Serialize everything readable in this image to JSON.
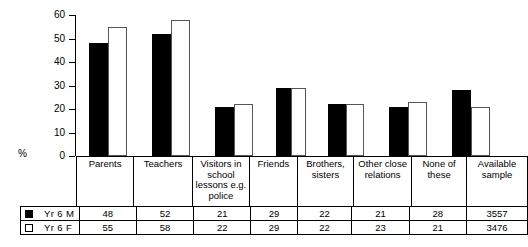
{
  "chart_data": {
    "type": "bar",
    "title": "",
    "xlabel": "",
    "ylabel": "%",
    "ylim": [
      0,
      60
    ],
    "yticks": [
      0,
      10,
      20,
      30,
      40,
      50,
      60
    ],
    "ytick_labels": [
      "0",
      "10",
      "20",
      "30",
      "40",
      "50",
      "60"
    ],
    "grid": false,
    "legend_position": "bottom-left-table",
    "categories": [
      "Parents",
      "Teachers",
      "Visitors in school lessons e.g. police",
      "Friends",
      "Brothers, sisters",
      "Other close relations",
      "None of these"
    ],
    "category_lines": [
      [
        "Parents"
      ],
      [
        "Teachers"
      ],
      [
        "Visitors in",
        "school",
        "lessons e.g.",
        "police"
      ],
      [
        "Friends"
      ],
      [
        "Brothers,",
        "sisters"
      ],
      [
        "Other close",
        "relations"
      ],
      [
        "None of these"
      ]
    ],
    "series": [
      {
        "name": "Yr 6 M",
        "color": "#000000",
        "fill": "solid",
        "values": [
          48,
          52,
          21,
          29,
          22,
          21,
          28
        ],
        "available_sample": "3557"
      },
      {
        "name": "Yr 6 F",
        "color": "#ffffff",
        "fill": "hollow",
        "values": [
          55,
          58,
          22,
          29,
          22,
          23,
          21
        ],
        "available_sample": "3476"
      }
    ],
    "extra_column_header": [
      "Available",
      "sample"
    ]
  },
  "table": {
    "extra_column_header_line1": "Available",
    "extra_column_header_line2": "sample",
    "row_m_label": "Yr 6 M",
    "row_f_label": "Yr 6 F"
  }
}
